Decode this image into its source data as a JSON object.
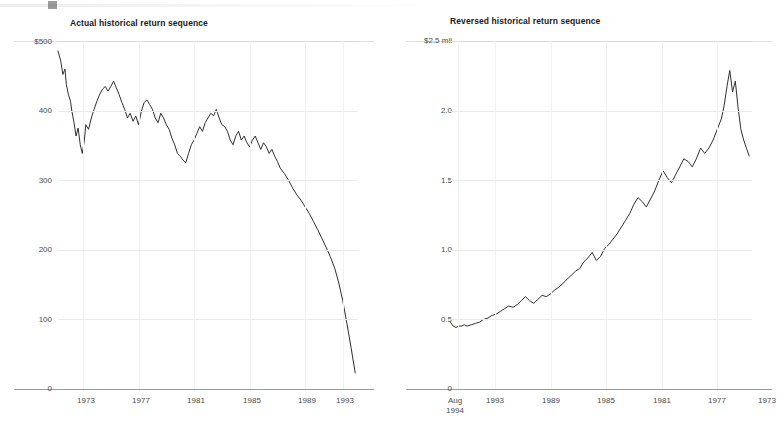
{
  "charts": [
    {
      "title": "Actual historical return sequence",
      "y_ticks": [
        "$500",
        "400",
        "300",
        "200",
        "100",
        "0"
      ],
      "x_ticks": [
        "1973",
        "1977",
        "1981",
        "1985",
        "1989",
        "1993"
      ]
    },
    {
      "title": "Reversed historical return sequence",
      "y_ticks": [
        "$2.5 mil",
        "2.0",
        "1.5",
        "1.0",
        "0.5",
        "0"
      ],
      "x_ticks_first": "Aug",
      "x_ticks_second": "1994",
      "x_ticks": [
        "1993",
        "1989",
        "1985",
        "1981",
        "1977",
        "1973"
      ]
    }
  ],
  "chart_data": [
    {
      "type": "line",
      "title": "Actual historical return sequence",
      "xlabel": "",
      "ylabel": "",
      "units": "thousands of dollars",
      "xlim": [
        1973,
        1994.6
      ],
      "ylim": [
        0,
        520
      ],
      "yticks": [
        0,
        100,
        200,
        300,
        400,
        500
      ],
      "ytick_labels": [
        "0",
        "100",
        "200",
        "300",
        "400",
        "$500"
      ],
      "xticks": [
        1973,
        1977,
        1981,
        1985,
        1989,
        1993
      ],
      "grid": true,
      "legend": "none",
      "series": [
        {
          "name": "Portfolio value (actual sequence)",
          "color": "#2f2f2f",
          "x": [
            1973.0,
            1973.2,
            1973.35,
            1973.5,
            1973.6,
            1973.75,
            1973.9,
            1974.0,
            1974.15,
            1974.3,
            1974.45,
            1974.6,
            1974.75,
            1974.9,
            1975.0,
            1975.2,
            1975.4,
            1975.6,
            1975.8,
            1976.0,
            1976.2,
            1976.4,
            1976.6,
            1976.8,
            1977.0,
            1977.2,
            1977.4,
            1977.6,
            1977.8,
            1978.0,
            1978.2,
            1978.4,
            1978.6,
            1978.8,
            1979.0,
            1979.2,
            1979.4,
            1979.6,
            1979.8,
            1980.0,
            1980.2,
            1980.4,
            1980.6,
            1980.8,
            1981.0,
            1981.2,
            1981.4,
            1981.6,
            1981.8,
            1982.0,
            1982.2,
            1982.4,
            1982.6,
            1982.8,
            1983.0,
            1983.2,
            1983.4,
            1983.6,
            1983.8,
            1984.0,
            1984.2,
            1984.4,
            1984.6,
            1984.8,
            1985.0,
            1985.2,
            1985.4,
            1985.6,
            1985.8,
            1986.0,
            1986.2,
            1986.4,
            1986.6,
            1986.8,
            1987.0,
            1987.2,
            1987.4,
            1987.6,
            1987.8,
            1988.0,
            1988.2,
            1988.4,
            1988.6,
            1988.8,
            1989.0,
            1989.3,
            1989.6,
            1989.9,
            1990.2,
            1990.5,
            1990.8,
            1991.1,
            1991.4,
            1991.7,
            1992.0,
            1992.3,
            1992.6,
            1992.9,
            1993.2,
            1993.5,
            1993.8,
            1994.1,
            1994.4
          ],
          "y": [
            505,
            490,
            470,
            478,
            455,
            440,
            430,
            415,
            398,
            378,
            390,
            365,
            352,
            372,
            395,
            388,
            405,
            418,
            430,
            440,
            448,
            452,
            445,
            452,
            460,
            450,
            440,
            428,
            418,
            405,
            412,
            400,
            408,
            395,
            415,
            428,
            432,
            425,
            418,
            405,
            398,
            412,
            405,
            395,
            388,
            375,
            365,
            352,
            348,
            342,
            338,
            352,
            365,
            372,
            382,
            392,
            385,
            398,
            405,
            412,
            408,
            418,
            405,
            395,
            392,
            385,
            372,
            365,
            378,
            385,
            372,
            378,
            368,
            362,
            372,
            378,
            368,
            358,
            368,
            362,
            352,
            358,
            348,
            340,
            330,
            322,
            312,
            300,
            290,
            282,
            272,
            262,
            250,
            238,
            225,
            212,
            198,
            182,
            160,
            132,
            98,
            62,
            24,
            2,
            0
          ]
        }
      ]
    },
    {
      "type": "line",
      "title": "Reversed historical return sequence",
      "xlabel": "",
      "ylabel": "",
      "units": "millions of dollars",
      "xlim": [
        1994.6,
        1972.8
      ],
      "ylim": [
        0,
        2.6
      ],
      "yticks": [
        0,
        0.5,
        1.0,
        1.5,
        2.0,
        2.5
      ],
      "ytick_labels": [
        "0",
        "0.5",
        "1.0",
        "1.5",
        "2.0",
        "$2.5 mil"
      ],
      "xticks": [
        1993,
        1989,
        1985,
        1981,
        1977,
        1973
      ],
      "x_axis_note": "Aug 1994",
      "x_reversed": true,
      "grid": true,
      "legend": "none",
      "series": [
        {
          "name": "Portfolio value (reversed sequence)",
          "color": "#2f2f2f",
          "x": [
            1994.5,
            1994.3,
            1994.1,
            1993.9,
            1993.7,
            1993.5,
            1993.3,
            1993.0,
            1992.7,
            1992.4,
            1992.1,
            1991.8,
            1991.5,
            1991.2,
            1990.9,
            1990.6,
            1990.3,
            1990.0,
            1989.7,
            1989.4,
            1989.1,
            1988.8,
            1988.5,
            1988.2,
            1987.9,
            1987.6,
            1987.3,
            1987.0,
            1986.7,
            1986.4,
            1986.1,
            1985.8,
            1985.5,
            1985.2,
            1984.9,
            1984.6,
            1984.3,
            1984.0,
            1983.7,
            1983.4,
            1983.1,
            1982.8,
            1982.5,
            1982.2,
            1981.9,
            1981.6,
            1981.3,
            1981.0,
            1980.7,
            1980.4,
            1980.1,
            1979.8,
            1979.5,
            1979.2,
            1978.9,
            1978.6,
            1978.3,
            1978.0,
            1977.7,
            1977.4,
            1977.1,
            1976.8,
            1976.5,
            1976.2,
            1975.9,
            1975.6,
            1975.3,
            1975.0,
            1974.8,
            1974.6,
            1974.4,
            1974.2,
            1974.0,
            1973.8,
            1973.6,
            1973.4,
            1973.2,
            1973.0
          ],
          "y": [
            0.5,
            0.47,
            0.46,
            0.47,
            0.47,
            0.48,
            0.47,
            0.48,
            0.49,
            0.5,
            0.52,
            0.53,
            0.55,
            0.56,
            0.58,
            0.6,
            0.62,
            0.61,
            0.63,
            0.66,
            0.69,
            0.66,
            0.64,
            0.67,
            0.7,
            0.69,
            0.71,
            0.74,
            0.76,
            0.79,
            0.82,
            0.85,
            0.88,
            0.9,
            0.95,
            0.98,
            1.02,
            0.96,
            0.99,
            1.05,
            1.08,
            1.12,
            1.16,
            1.21,
            1.26,
            1.31,
            1.38,
            1.43,
            1.4,
            1.36,
            1.42,
            1.48,
            1.56,
            1.63,
            1.58,
            1.54,
            1.6,
            1.66,
            1.72,
            1.7,
            1.66,
            1.72,
            1.8,
            1.76,
            1.8,
            1.86,
            1.94,
            2.02,
            2.12,
            2.26,
            2.38,
            2.22,
            2.3,
            2.1,
            1.94,
            1.86,
            1.8,
            1.74
          ]
        }
      ]
    }
  ]
}
